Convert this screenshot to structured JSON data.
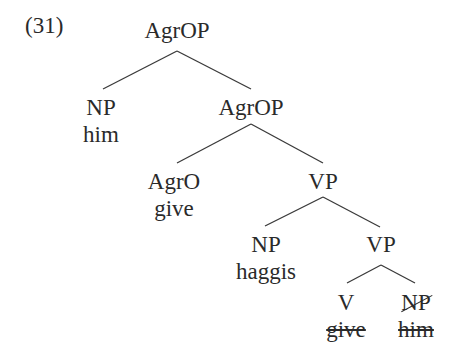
{
  "example_number": "(31)",
  "tree": {
    "root": {
      "label": "AgrOP"
    },
    "np_him": {
      "label": "NP",
      "word": "him"
    },
    "agrop2": {
      "label": "AgrOP"
    },
    "agro": {
      "label": "AgrO",
      "word": "give"
    },
    "vp1": {
      "label": "VP"
    },
    "np_haggis": {
      "label": "NP",
      "word": "haggis"
    },
    "vp2": {
      "label": "VP"
    },
    "v_trace": {
      "label": "V",
      "word": "give",
      "deleted": true
    },
    "np_trace": {
      "label": "NP",
      "word": "him",
      "deleted": true
    }
  },
  "edges": [
    [
      "root",
      "np_him"
    ],
    [
      "root",
      "agrop2"
    ],
    [
      "agrop2",
      "agro"
    ],
    [
      "agrop2",
      "vp1"
    ],
    [
      "vp1",
      "np_haggis"
    ],
    [
      "vp1",
      "vp2"
    ],
    [
      "vp2",
      "v_trace"
    ],
    [
      "vp2",
      "np_trace"
    ]
  ]
}
